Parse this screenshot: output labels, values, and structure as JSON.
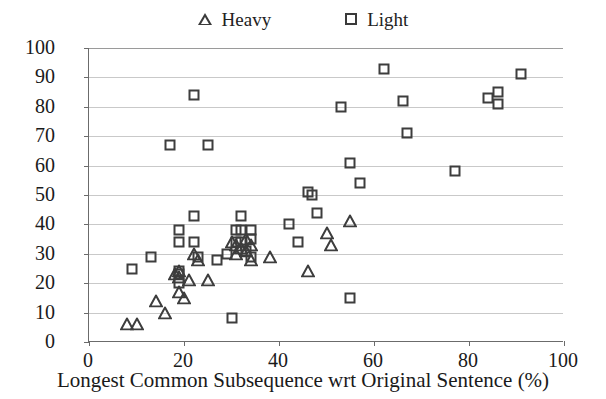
{
  "chart_data": {
    "type": "scatter",
    "title": "",
    "xlabel": "Longest Common Subsequence wrt Original Sentence (%)",
    "ylabel": "LCS wrt Revised Sentence (%)",
    "xlim": [
      0,
      100
    ],
    "ylim": [
      0,
      100
    ],
    "xticks": [
      0,
      20,
      40,
      60,
      80,
      100
    ],
    "yticks": [
      0,
      10,
      20,
      30,
      40,
      50,
      60,
      70,
      80,
      90,
      100
    ],
    "grid": "horizontal",
    "legend_position": "top-center",
    "series": [
      {
        "name": "Heavy",
        "marker": "triangle",
        "color": "#3d3d3d",
        "points": [
          [
            8,
            6
          ],
          [
            10,
            6
          ],
          [
            14,
            14
          ],
          [
            16,
            10
          ],
          [
            18,
            23
          ],
          [
            19,
            24
          ],
          [
            19,
            22
          ],
          [
            19,
            17
          ],
          [
            20,
            15
          ],
          [
            21,
            21
          ],
          [
            22,
            30
          ],
          [
            23,
            28
          ],
          [
            25,
            21
          ],
          [
            30,
            34
          ],
          [
            31,
            33
          ],
          [
            31,
            30
          ],
          [
            32,
            32
          ],
          [
            33,
            31
          ],
          [
            33,
            35
          ],
          [
            34,
            33
          ],
          [
            34,
            28
          ],
          [
            38,
            29
          ],
          [
            46,
            24
          ],
          [
            50,
            37
          ],
          [
            51,
            33
          ],
          [
            55,
            41
          ]
        ]
      },
      {
        "name": "Light",
        "marker": "square",
        "color": "#3d3d3d",
        "points": [
          [
            9,
            25
          ],
          [
            13,
            29
          ],
          [
            17,
            67
          ],
          [
            19,
            38
          ],
          [
            19,
            34
          ],
          [
            19,
            24
          ],
          [
            19,
            23
          ],
          [
            19,
            20
          ],
          [
            22,
            84
          ],
          [
            22,
            43
          ],
          [
            22,
            34
          ],
          [
            23,
            29
          ],
          [
            25,
            67
          ],
          [
            27,
            28
          ],
          [
            29,
            30
          ],
          [
            30,
            8
          ],
          [
            31,
            38
          ],
          [
            31,
            34
          ],
          [
            32,
            43
          ],
          [
            32,
            38
          ],
          [
            32,
            34
          ],
          [
            33,
            31
          ],
          [
            34,
            38
          ],
          [
            34,
            35
          ],
          [
            34,
            29
          ],
          [
            42,
            40
          ],
          [
            44,
            34
          ],
          [
            46,
            51
          ],
          [
            47,
            50
          ],
          [
            48,
            44
          ],
          [
            53,
            80
          ],
          [
            55,
            61
          ],
          [
            55,
            15
          ],
          [
            57,
            54
          ],
          [
            62,
            93
          ],
          [
            66,
            82
          ],
          [
            67,
            71
          ],
          [
            77,
            58
          ],
          [
            84,
            83
          ],
          [
            86,
            85
          ],
          [
            86,
            81
          ],
          [
            91,
            91
          ]
        ]
      }
    ]
  },
  "legend": {
    "entries": [
      {
        "label": "Heavy",
        "marker": "triangle-marker-icon"
      },
      {
        "label": "Light",
        "marker": "square-marker-icon"
      }
    ]
  },
  "axes": {
    "y_title": "LCS wrt Revised Sentence (%)",
    "x_title": "Longest Common Subsequence wrt Original Sentence (%)",
    "y_tick_labels": [
      "100",
      "90",
      "80",
      "70",
      "60",
      "50",
      "40",
      "30",
      "20",
      "10",
      "0"
    ],
    "x_tick_labels": [
      "0",
      "20",
      "40",
      "60",
      "80",
      "100"
    ]
  }
}
